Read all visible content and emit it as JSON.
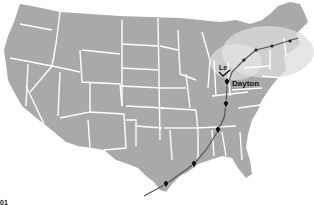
{
  "map": {
    "title": "United States map with route line",
    "colors": {
      "land": "#a9a9a9",
      "state_border": "#ffffff",
      "highlight_glow": "#d8d8d8",
      "route": "#555555",
      "marker": "#111111",
      "background": "#ffffff"
    },
    "labels": {
      "city": "Dayton",
      "partial_label": "Le",
      "corner_partial": "01"
    },
    "markers": [
      {
        "name": "ne-marker-1",
        "x": 244,
        "y": 62
      },
      {
        "name": "ne-marker-2",
        "x": 256,
        "y": 50
      },
      {
        "name": "ne-marker-3",
        "x": 272,
        "y": 47
      },
      {
        "name": "ne-marker-4",
        "x": 290,
        "y": 44
      },
      {
        "name": "dayton-marker",
        "x": 227,
        "y": 82
      },
      {
        "name": "marker-kentucky",
        "x": 226,
        "y": 104
      },
      {
        "name": "marker-tennessee",
        "x": 226,
        "y": 118
      },
      {
        "name": "marker-alabama",
        "x": 218,
        "y": 130
      },
      {
        "name": "marker-mississippi",
        "x": 194,
        "y": 164
      },
      {
        "name": "marker-texas",
        "x": 166,
        "y": 184
      }
    ]
  }
}
